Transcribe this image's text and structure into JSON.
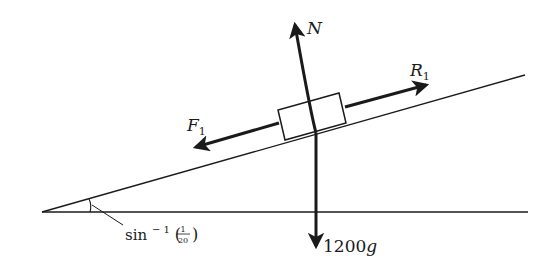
{
  "diagram": {
    "type": "force-diagram",
    "colors": {
      "ink": "#1a1a1a",
      "background": "#ffffff"
    },
    "incline": {
      "angle_label": {
        "prefix": "sin",
        "superscript": "− 1",
        "open_paren": "(",
        "numerator": "1",
        "denominator": "20",
        "close_paren": ")"
      }
    },
    "forces": {
      "normal": {
        "label": "N"
      },
      "resistance": {
        "label": "R",
        "subscript": "1"
      },
      "friction": {
        "label": "F",
        "subscript": "1"
      },
      "weight": {
        "label": "1200",
        "unit": "g"
      }
    }
  }
}
